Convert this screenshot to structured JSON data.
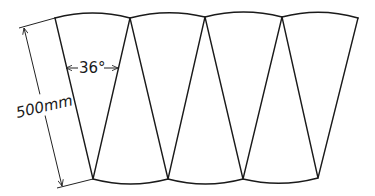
{
  "figure": {
    "stroke_color": "#1a1a1a",
    "background": "#ffffff",
    "top_vertices": [
      [
        55,
        18
      ],
      [
        130,
        18
      ],
      [
        205,
        17
      ],
      [
        282,
        17
      ],
      [
        358,
        18
      ]
    ],
    "bottom_vertices": [
      [
        93,
        179
      ],
      [
        168,
        179
      ],
      [
        243,
        179
      ],
      [
        318,
        178
      ]
    ],
    "panels": 4
  },
  "annotations": {
    "angle_label": "36°",
    "length_label": "500mm"
  }
}
